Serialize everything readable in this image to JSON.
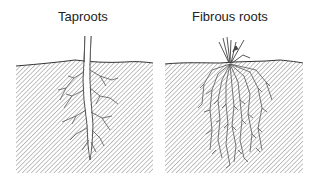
{
  "diagram": {
    "panels": [
      {
        "title": "Taproots",
        "type": "taproot",
        "description": "Single thick main root with smaller lateral branches"
      },
      {
        "title": "Fibrous roots",
        "type": "fibrous",
        "description": "Grass-like tuft with many thin roots of similar size"
      }
    ],
    "colors": {
      "soil_hatch": "#9a9a9a",
      "ground_line": "#333333",
      "root_stroke": "#555555",
      "text": "#222222"
    }
  }
}
